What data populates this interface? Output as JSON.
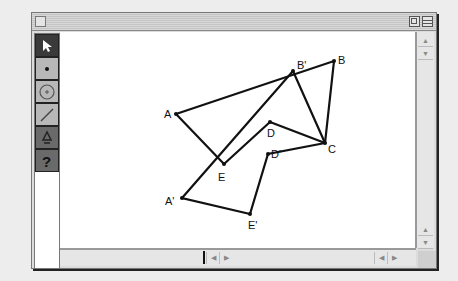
{
  "window": {
    "title": "",
    "controls": [
      "close-box",
      "zoom-box",
      "collapse-box"
    ]
  },
  "toolbox": {
    "tools": [
      {
        "name": "selection-arrow",
        "glyph": "➤",
        "selected": true
      },
      {
        "name": "point",
        "glyph": "•",
        "selected": false
      },
      {
        "name": "compass-circle",
        "glyph": "⊕",
        "selected": false
      },
      {
        "name": "straightedge",
        "glyph": "/",
        "selected": false
      },
      {
        "name": "script-tool",
        "glyph": "⁂",
        "selected": false
      },
      {
        "name": "help",
        "glyph": "?",
        "selected": false
      }
    ]
  },
  "sketch": {
    "points": {
      "A": {
        "label": "A",
        "x": 116,
        "y": 82
      },
      "B": {
        "label": "B",
        "x": 274,
        "y": 29
      },
      "C": {
        "label": "C",
        "x": 265,
        "y": 111
      },
      "D": {
        "label": "D",
        "x": 210,
        "y": 90
      },
      "E": {
        "label": "E",
        "x": 164,
        "y": 132
      },
      "A_prime": {
        "label": "A'",
        "x": 122,
        "y": 166
      },
      "B_prime": {
        "label": "B'",
        "x": 233,
        "y": 39
      },
      "D_prime": {
        "label": "D'",
        "x": 208,
        "y": 122
      },
      "E_prime": {
        "label": "E'",
        "x": 190,
        "y": 182
      }
    },
    "polygons": [
      {
        "name": "ABCDE",
        "vertices": [
          "A",
          "B",
          "C",
          "D",
          "E"
        ]
      },
      {
        "name": "A'B'CD'E'",
        "vertices": [
          "A_prime",
          "B_prime",
          "C",
          "D_prime",
          "E_prime"
        ]
      }
    ]
  },
  "scrollbars": {
    "vertical": {
      "up": "▲",
      "down": "▼"
    },
    "horizontal": {
      "left": "◀",
      "right": "▶"
    }
  }
}
